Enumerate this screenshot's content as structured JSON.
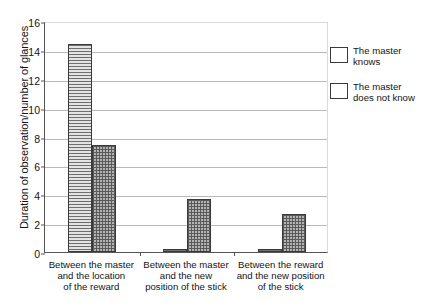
{
  "chart_data": {
    "type": "bar",
    "title": "",
    "subtitle": "",
    "xlabel": "",
    "ylabel": "Duration of observation/number of glances",
    "ylim": [
      0,
      16
    ],
    "yticks": [
      0,
      2,
      4,
      6,
      8,
      10,
      12,
      14,
      16
    ],
    "grid": true,
    "legend_position": "right",
    "categories": [
      "Between the master\nand the location\nof the reward",
      "Between the master\nand the new\nposition of the stick",
      "Between the reward\nand the new position\nof the stick"
    ],
    "category_lines": [
      [
        "Between the master",
        "and the location",
        "of the reward"
      ],
      [
        "Between the master",
        "and the new",
        "position of the stick"
      ],
      [
        "Between the reward",
        "and the new position",
        "of the stick"
      ]
    ],
    "series": [
      {
        "name": "The master knows",
        "pattern": "horizontal-lines",
        "color": "#c8c8c8",
        "values": [
          14.4,
          0.2,
          0.2
        ]
      },
      {
        "name": "The master does not know",
        "pattern": "crosshatch-grid",
        "color": "#b4b4b4",
        "values": [
          7.4,
          3.7,
          2.6
        ]
      }
    ]
  },
  "legend": {
    "items": [
      {
        "label_line1": "The master",
        "label_line2": "knows"
      },
      {
        "label_line1": "The master",
        "label_line2": "does not know"
      }
    ]
  },
  "axis": {
    "y_title": "Duration of observation/number of glances",
    "y_tick_labels": [
      "0",
      "2",
      "4",
      "6",
      "8",
      "10",
      "12",
      "14",
      "16"
    ]
  }
}
